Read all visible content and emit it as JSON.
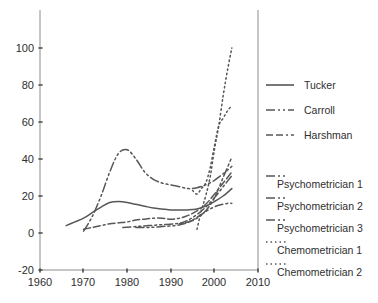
{
  "chart_data": {
    "type": "line",
    "title": "",
    "subtitle": "",
    "xlabel": "",
    "ylabel": "",
    "xlim": [
      1960,
      2010
    ],
    "ylim": [
      -20,
      100
    ],
    "grid": false,
    "legend_position": "right",
    "xticks": [
      "1960",
      "1970",
      "1980",
      "1990",
      "2000",
      "2010"
    ],
    "xtick_values": [
      1960,
      1970,
      1980,
      1990,
      2000,
      2010
    ],
    "yticks": [
      "-20",
      "0",
      "20",
      "40",
      "60",
      "80",
      "100"
    ],
    "ytick_values": [
      -20,
      0,
      20,
      40,
      60,
      80,
      100
    ],
    "series": [
      {
        "name": "Tucker",
        "style": "solid",
        "dash": "none",
        "color": "#575757",
        "x": [
          1966,
          1968,
          1970,
          1972,
          1974,
          1976,
          1978,
          1980,
          1982,
          1984,
          1986,
          1988,
          1990,
          1992,
          1994,
          1996,
          1998,
          2000,
          2002,
          2004
        ],
        "y": [
          4,
          6,
          8,
          11,
          14,
          16.5,
          17,
          16.5,
          15.5,
          14.5,
          13.5,
          13,
          12.5,
          12.5,
          12.5,
          13,
          14.5,
          17,
          20,
          24
        ]
      },
      {
        "name": "Carroll",
        "style": "dash-dot-dot",
        "dash": "9,3,2,3,2,3",
        "color": "#575757",
        "x": [
          1970,
          1972,
          1974,
          1976,
          1978,
          1980,
          1982,
          1984,
          1986,
          1988,
          1990,
          1992,
          1994,
          1996,
          1998,
          2000,
          2002,
          2004
        ],
        "y": [
          1,
          9,
          20,
          33,
          43,
          45,
          40,
          33,
          29,
          27,
          26,
          25,
          24,
          24.5,
          26,
          28.5,
          32,
          36
        ]
      },
      {
        "name": "Harshman",
        "style": "dash-dash-dot",
        "dash": "7,3,7,3,2,3",
        "color": "#575757",
        "x": [
          1970,
          1972,
          1974,
          1976,
          1978,
          1980,
          1982,
          1984,
          1986,
          1988,
          1990,
          1992,
          1994,
          1996,
          1998,
          2000,
          2002,
          2004
        ],
        "y": [
          2,
          3,
          4,
          5,
          5.5,
          6,
          7,
          7.5,
          8,
          8,
          7.5,
          8,
          9.5,
          12,
          15.5,
          21,
          27,
          33
        ]
      },
      {
        "name": "Psychometrician 1",
        "style": "dash-dot-dot",
        "dash": "8,3,2,3,2,3",
        "color": "#575757",
        "x": [
          1979,
          1982,
          1985,
          1988,
          1991,
          1994,
          1996,
          1998,
          2000,
          2002,
          2004
        ],
        "y": [
          3,
          3.5,
          4,
          4.5,
          5,
          6,
          8,
          12,
          19,
          30,
          41
        ]
      },
      {
        "name": "Psychometrician 2",
        "style": "dash-dot-dot",
        "dash": "8,3,2,3,2,3",
        "color": "#575757",
        "x": [
          1982,
          1985,
          1988,
          1991,
          1993,
          1995,
          1997,
          1999,
          2001,
          2003,
          2004
        ],
        "y": [
          3,
          3,
          3.5,
          4,
          5,
          7,
          10,
          13,
          15,
          16,
          16
        ]
      },
      {
        "name": "Psychometrician 3",
        "style": "dash-dot-dot",
        "dash": "8,3,2,3,2,3",
        "color": "#575757",
        "x": [
          1992,
          1994,
          1996,
          1998,
          2000,
          2002,
          2004
        ],
        "y": [
          5,
          7,
          10,
          14,
          19,
          25,
          31
        ]
      },
      {
        "name": "Chemometrician 1",
        "style": "dotted",
        "dash": "1.5,3",
        "color": "#575757",
        "x": [
          1995,
          1996,
          1997,
          1998,
          1999,
          2000,
          2001,
          2002,
          2003,
          2004
        ],
        "y": [
          23,
          21,
          24,
          27,
          35,
          47,
          58,
          62,
          66,
          69
        ]
      },
      {
        "name": "Chemometrician 2",
        "style": "dotted",
        "dash": "1.5,3",
        "color": "#575757",
        "x": [
          1996,
          1997,
          1998,
          1999,
          2000,
          2001,
          2002,
          2003,
          2004
        ],
        "y": [
          2,
          12,
          20,
          30,
          45,
          58,
          74,
          88,
          100
        ]
      }
    ]
  },
  "legend": {
    "items": [
      {
        "label": "Tucker",
        "style": "solid"
      },
      {
        "label": "Carroll",
        "style": "dash-dot-dot"
      },
      {
        "label": "Harshman",
        "style": "dash-dash-dot"
      },
      {
        "label": "Psychometrician 1",
        "style": "dash-dot-dot"
      },
      {
        "label": "Psychometrician 2",
        "style": "dash-dot-dot"
      },
      {
        "label": "Psychometrician 3",
        "style": "dash-dot-dot"
      },
      {
        "label": "Chemometrician 1",
        "style": "dotted"
      },
      {
        "label": "Chemometrician 2",
        "style": "dotted"
      }
    ]
  },
  "colors": {
    "line": "#575757",
    "axis": "#8c8c8c",
    "text": "#2e2e2e",
    "background": "#ffffff"
  }
}
